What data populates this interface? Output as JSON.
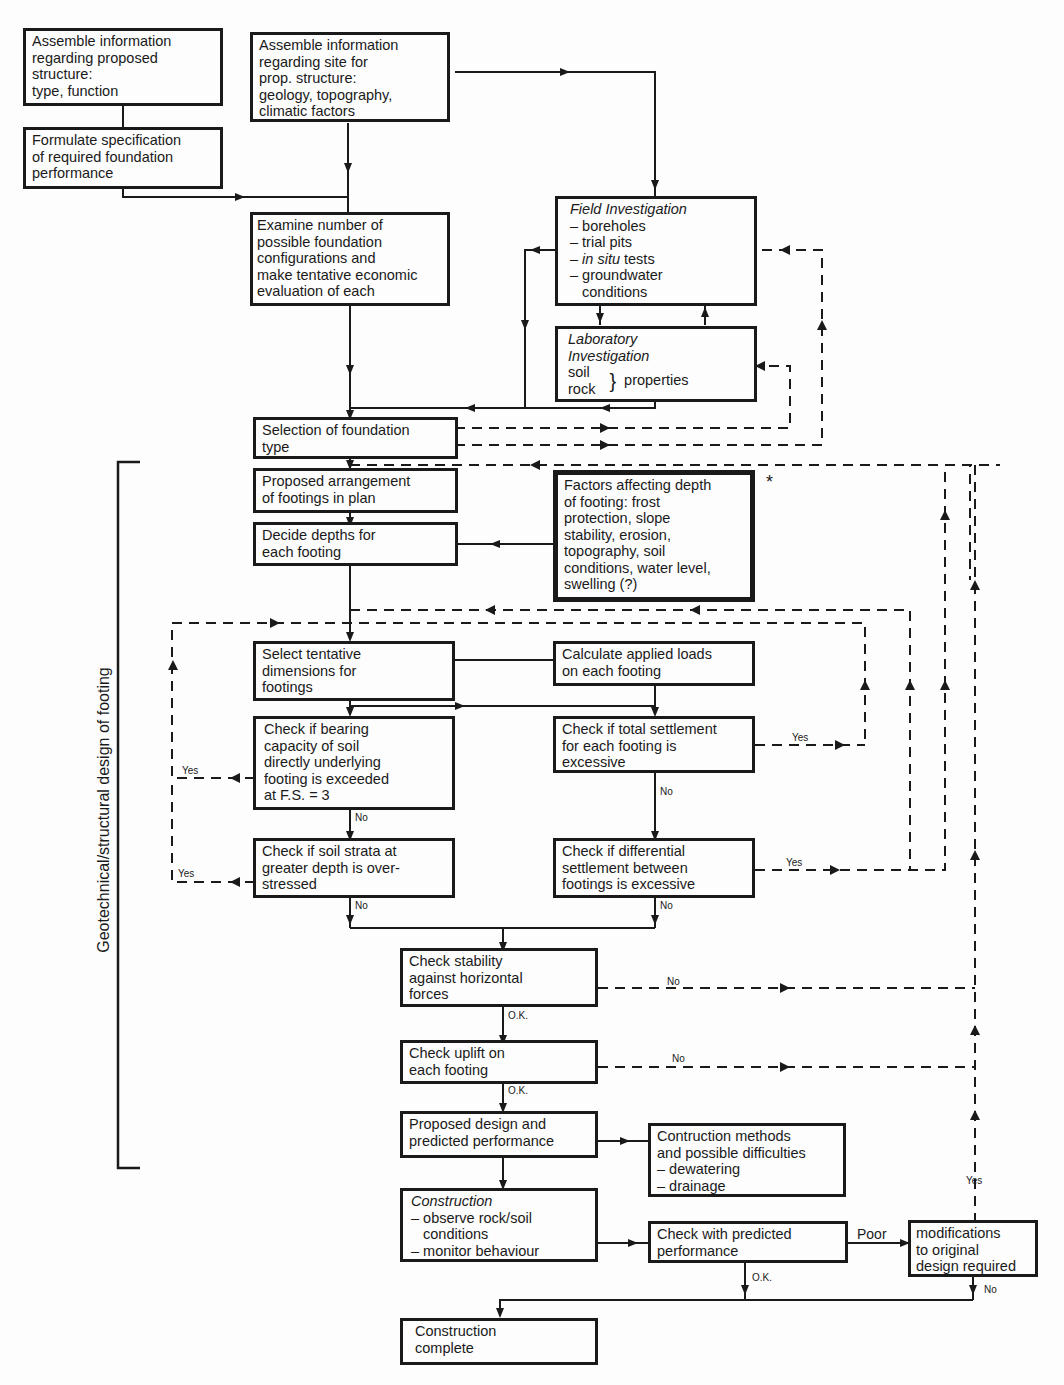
{
  "diagram": {
    "side_label": "Geotechnical/structural design of footing",
    "footnote_marker": "*",
    "boxes": {
      "b1": [
        "Assemble information",
        "regarding proposed",
        "structure:",
        "type, function"
      ],
      "b2": [
        "Formulate specification",
        "of required foundation",
        "performance"
      ],
      "b3": [
        "Assemble information",
        "regarding site for",
        "prop. structure:",
        "geology, topography,",
        "climatic factors"
      ],
      "b4": [
        "Examine number of",
        "possible foundation",
        "configurations and",
        "make tentative economic",
        "evaluation of each"
      ],
      "field": {
        "title": "Field Investigation",
        "items": [
          "– boreholes",
          "– trial pits",
          "– in situ tests",
          "– groundwater",
          "   conditions"
        ],
        "item_italic_prefix": "in situ",
        "item_rest": " tests"
      },
      "lab": {
        "title1": "Laboratory",
        "title2": "Investigation",
        "soil": "soil",
        "rock": "rock",
        "brace": "}",
        "properties": "properties"
      },
      "b5": [
        "Selection of foundation",
        "type"
      ],
      "b6": [
        "Proposed arrangement",
        "of footings in plan"
      ],
      "b7": [
        "Decide depths for",
        "each footing"
      ],
      "factors": [
        "Factors affecting depth",
        "of footing: frost",
        "protection, slope",
        "stability, erosion,",
        "topography, soil",
        "conditions, water level,",
        "swelling (?)"
      ],
      "b8": [
        "Select tentative",
        "dimensions for",
        "footings"
      ],
      "b9": [
        "Calculate applied loads",
        "on each footing"
      ],
      "b10": [
        "Check if bearing",
        "capacity of soil",
        "directly underlying",
        "footing is exceeded",
        "at F.S. = 3"
      ],
      "b11": [
        "Check if total settlement",
        "for each footing is",
        "excessive"
      ],
      "b12": [
        "Check if soil strata at",
        "greater depth is over-",
        "stressed"
      ],
      "b13": [
        "Check if differential",
        "settlement between",
        "footings is excessive"
      ],
      "b14": [
        "Check stability",
        "against horizontal",
        "forces"
      ],
      "b15": [
        "Check uplift on",
        "each footing"
      ],
      "b16": [
        "Proposed design and",
        "predicted performance"
      ],
      "b17": [
        "Contruction methods",
        "and possible difficulties",
        "– dewatering",
        "– drainage"
      ],
      "b18": {
        "title": "Construction",
        "items": [
          "– observe rock/soil",
          "   conditions",
          "– monitor behaviour"
        ]
      },
      "b19": [
        "Check with predicted",
        "performance"
      ],
      "b20": [
        "modifications",
        "to original",
        "design required"
      ],
      "b21": [
        "Construction",
        "complete"
      ]
    },
    "labels": {
      "yes": "Yes",
      "no": "No",
      "ok": "O.K.",
      "poor": "Poor"
    },
    "colors": {
      "ink": "#1a1a1a",
      "paper": "#fdfdfd"
    }
  }
}
